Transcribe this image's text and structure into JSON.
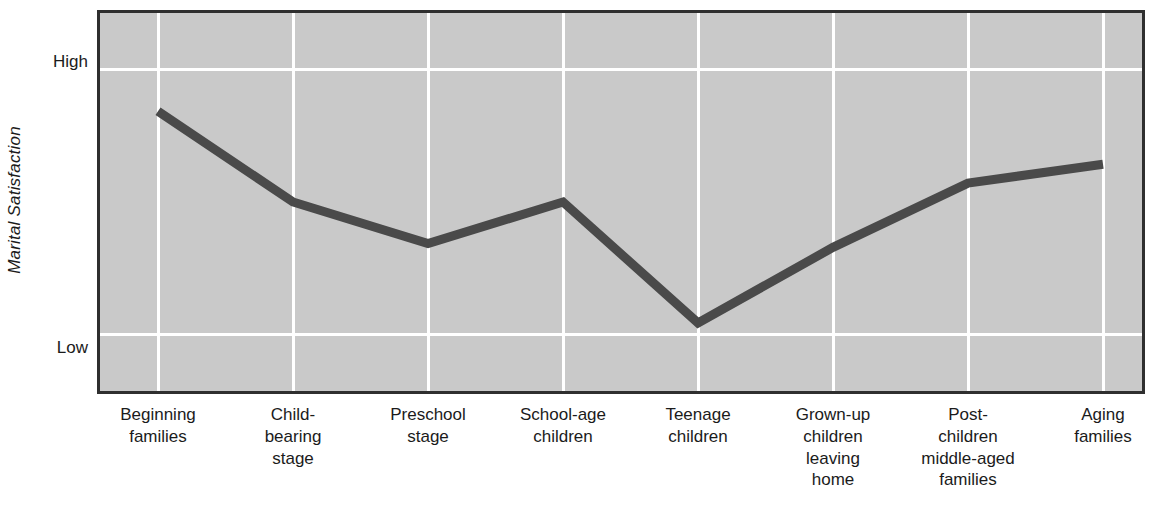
{
  "chart_data": {
    "type": "line",
    "title": "",
    "subtitle": "",
    "xlabel": "",
    "ylabel": "Marital Satisfaction",
    "categories": [
      "Beginning families",
      "Child-bearing stage",
      "Preschool stage",
      "School-age children",
      "Teenage children",
      "Grown-up children leaving home",
      "Post-children middle-aged families",
      "Aging families"
    ],
    "category_lines": [
      [
        "Beginning",
        "families"
      ],
      [
        "Child-",
        "bearing",
        "stage"
      ],
      [
        "Preschool",
        "stage"
      ],
      [
        "School-age",
        "children"
      ],
      [
        "Teenage",
        "children"
      ],
      [
        "Grown-up",
        "children",
        "leaving",
        "home"
      ],
      [
        "Post-",
        "children",
        "middle-aged",
        "families"
      ],
      [
        "Aging",
        "families"
      ]
    ],
    "ytick_labels": [
      "High",
      "Low"
    ],
    "ylim": [
      0,
      100
    ],
    "ytick_values": [
      85,
      15
    ],
    "values": [
      74,
      50,
      39,
      50,
      18,
      38,
      55,
      60
    ],
    "series": [
      {
        "name": "Marital satisfaction over the family life cycle",
        "values": [
          74,
          50,
          39,
          50,
          18,
          38,
          55,
          60
        ]
      }
    ],
    "grid": {
      "vertical": true,
      "horizontal": true,
      "color": "#ffffff"
    },
    "legend": {
      "visible": false,
      "position": "none"
    },
    "colors": {
      "plot_background": "#c9c9c9",
      "line": "#4a4a4a",
      "frame": "#2f2f2f",
      "grid": "#ffffff",
      "text": "#1b1b1b",
      "page_background": "#ffffff"
    },
    "line_width_px": 9,
    "annotations": []
  }
}
